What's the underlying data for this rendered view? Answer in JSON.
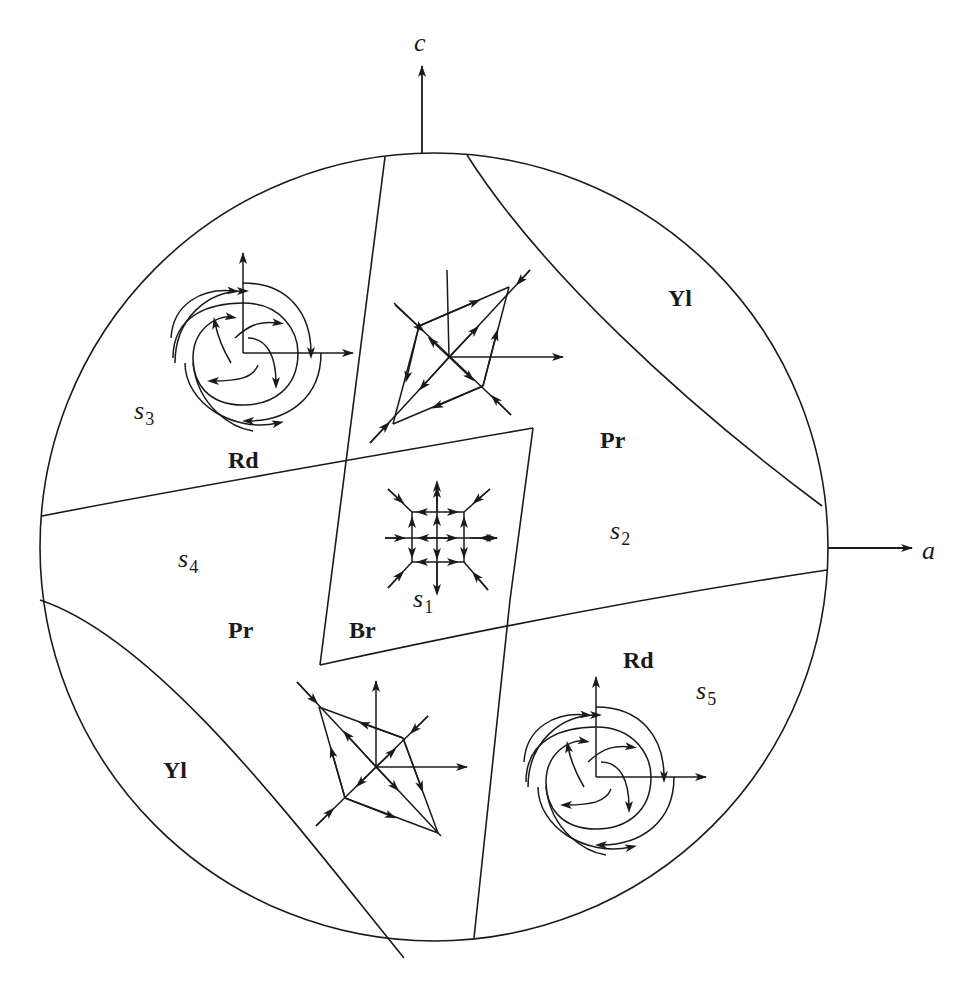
{
  "figure": {
    "axes": {
      "vertical": {
        "label": "c"
      },
      "horizontal": {
        "label": "a"
      }
    },
    "regions": [
      {
        "id": "yl-top-right",
        "label": "Yl"
      },
      {
        "id": "pr-right",
        "label": "Pr"
      },
      {
        "id": "rd-top-left",
        "label": "Rd"
      },
      {
        "id": "pr-left",
        "label": "Pr"
      },
      {
        "id": "br-center",
        "label": "Br"
      },
      {
        "id": "rd-bottom-right",
        "label": "Rd"
      },
      {
        "id": "yl-bottom-left",
        "label": "Yl"
      }
    ],
    "points": [
      {
        "id": "s1",
        "symbol": "s",
        "subscript": "1"
      },
      {
        "id": "s2",
        "symbol": "s",
        "subscript": "2"
      },
      {
        "id": "s3",
        "symbol": "s",
        "subscript": "3"
      },
      {
        "id": "s4",
        "symbol": "s",
        "subscript": "4"
      },
      {
        "id": "s5",
        "symbol": "s",
        "subscript": "5"
      }
    ],
    "phase_portraits": [
      {
        "id": "spiral-top-left",
        "type": "spiral"
      },
      {
        "id": "saddle-node-top-center",
        "type": "star/saddle"
      },
      {
        "id": "grid-center",
        "type": "grid"
      },
      {
        "id": "saddle-node-bottom-center",
        "type": "star/saddle"
      },
      {
        "id": "spiral-bottom-right",
        "type": "spiral"
      }
    ],
    "colors": {
      "ink": "#1a1a1a",
      "background": "#ffffff"
    }
  }
}
